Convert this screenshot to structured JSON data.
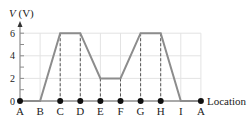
{
  "chart_data": {
    "type": "line",
    "title": "",
    "xlabel": "Location",
    "ylabel": "V (V)",
    "ylabel_italic_part": "V",
    "ylabel_unit_part": " (V)",
    "categories": [
      "A",
      "B",
      "C",
      "D",
      "E",
      "F",
      "G",
      "H",
      "I",
      "A"
    ],
    "values": [
      0,
      0,
      6,
      6,
      2,
      2,
      6,
      6,
      0,
      0
    ],
    "y_ticks": [
      0,
      2,
      4,
      6
    ],
    "y_tick_labels": [
      "0",
      "2",
      "4",
      "6"
    ],
    "ylim": [
      0,
      6.8
    ],
    "grid": true,
    "dashed_drop_lines_at": [
      "C",
      "D",
      "E",
      "F",
      "G",
      "H"
    ],
    "marked_points_on_axis": [
      "A",
      "C",
      "D",
      "E",
      "F",
      "G",
      "H",
      "A"
    ],
    "line_color": "#8c8c8c",
    "grid_color": "#e3e3e3",
    "axis_color": "#8c8c8c",
    "marker_color": "#111111"
  }
}
